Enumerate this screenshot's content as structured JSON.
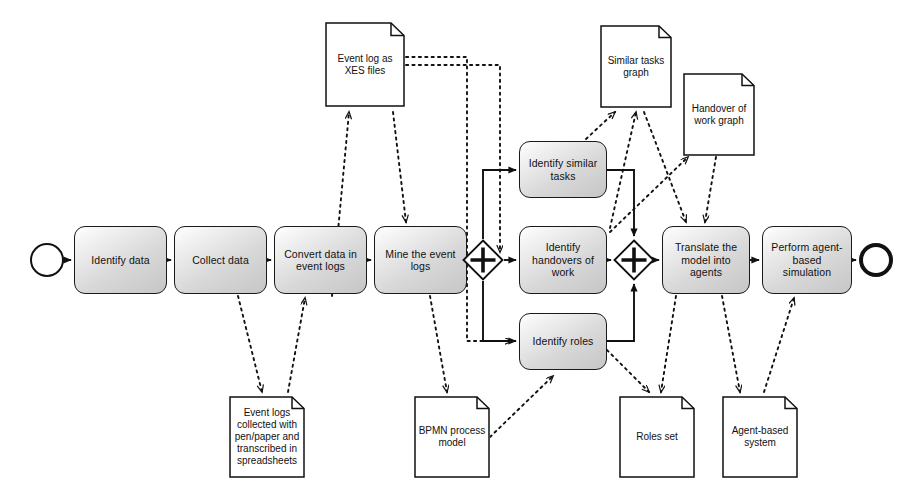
{
  "diagram": {
    "type": "BPMN process diagram",
    "notation": "bpmn",
    "background_color": "#ffffff",
    "line_color": "#111111",
    "task_fill_top": "#ffffff",
    "task_fill_bottom": "#c6c6c6"
  },
  "events": [
    {
      "id": "start",
      "kind": "start-event",
      "label": "",
      "x": 30,
      "y": 243,
      "d": 34
    },
    {
      "id": "end",
      "kind": "end-event",
      "label": "",
      "x": 859,
      "y": 243,
      "d": 34
    }
  ],
  "tasks": [
    {
      "id": "t1",
      "label": "Identify data",
      "x": 74,
      "y": 226,
      "w": 93,
      "h": 68
    },
    {
      "id": "t2",
      "label": "Collect data",
      "x": 174,
      "y": 226,
      "w": 93,
      "h": 68
    },
    {
      "id": "t3",
      "label": "Convert data in\nevent logs",
      "x": 274,
      "y": 226,
      "w": 93,
      "h": 68
    },
    {
      "id": "t4",
      "label": "Mine the event\nlogs",
      "x": 374,
      "y": 226,
      "w": 93,
      "h": 68
    },
    {
      "id": "t5",
      "label": "Identify similar\ntasks",
      "x": 519,
      "y": 141,
      "w": 88,
      "h": 57
    },
    {
      "id": "t6",
      "label": "Identify\nhandovers of\nwork",
      "x": 519,
      "y": 226,
      "w": 88,
      "h": 68
    },
    {
      "id": "t7",
      "label": "Identify roles",
      "x": 519,
      "y": 313,
      "w": 88,
      "h": 57
    },
    {
      "id": "t8",
      "label": "Translate the\nmodel into\nagents",
      "x": 662,
      "y": 226,
      "w": 88,
      "h": 68
    },
    {
      "id": "t9",
      "label": "Perform agent-\nbased simulation",
      "x": 762,
      "y": 226,
      "w": 90,
      "h": 68
    }
  ],
  "gateways": [
    {
      "id": "g1",
      "kind": "parallel-gateway-split",
      "symbol": "+",
      "cx": 483,
      "cy": 260,
      "r": 21
    },
    {
      "id": "g2",
      "kind": "parallel-gateway-join",
      "symbol": "+",
      "cx": 634,
      "cy": 260,
      "r": 21
    }
  ],
  "data_objects": [
    {
      "id": "d1",
      "label": "Event log as\nXES files",
      "x": 325,
      "y": 22,
      "w": 80,
      "h": 85
    },
    {
      "id": "d2",
      "label": "Similar tasks\ngraph",
      "x": 600,
      "y": 25,
      "w": 72,
      "h": 83
    },
    {
      "id": "d3",
      "label": "Handover of\nwork graph",
      "x": 683,
      "y": 73,
      "w": 72,
      "h": 83
    },
    {
      "id": "d4",
      "label": "Event logs\ncollected with\npen/paper and\ntranscribed in\nspreadsheets",
      "x": 229,
      "y": 396,
      "w": 76,
      "h": 82
    },
    {
      "id": "d5",
      "label": "BPMN process\nmodel",
      "x": 414,
      "y": 396,
      "w": 76,
      "h": 82
    },
    {
      "id": "d6",
      "label": "Roles set",
      "x": 619,
      "y": 396,
      "w": 76,
      "h": 82
    },
    {
      "id": "d7",
      "label": "Agent-based\nsystem",
      "x": 722,
      "y": 396,
      "w": 76,
      "h": 82
    }
  ],
  "sequence_flows": [
    {
      "from": "start",
      "to": "t1"
    },
    {
      "from": "t1",
      "to": "t2"
    },
    {
      "from": "t2",
      "to": "t3"
    },
    {
      "from": "t3",
      "to": "t4"
    },
    {
      "from": "t4",
      "to": "g1"
    },
    {
      "from": "g1",
      "to": "t5"
    },
    {
      "from": "g1",
      "to": "t6"
    },
    {
      "from": "g1",
      "to": "t7"
    },
    {
      "from": "t5",
      "to": "g2"
    },
    {
      "from": "t6",
      "to": "g2"
    },
    {
      "from": "t7",
      "to": "g2"
    },
    {
      "from": "g2",
      "to": "t8"
    },
    {
      "from": "t8",
      "to": "t9"
    },
    {
      "from": "t9",
      "to": "end"
    }
  ],
  "associations": [
    {
      "from": "t2",
      "to": "d4"
    },
    {
      "from": "d4",
      "to": "t3"
    },
    {
      "from": "t3",
      "to": "d1"
    },
    {
      "from": "d1",
      "to": "t4"
    },
    {
      "from": "t4",
      "to": "d5"
    },
    {
      "from": "d5",
      "to": "t7"
    },
    {
      "from": "d1",
      "to": "t6"
    },
    {
      "from": "d1",
      "to": "t7"
    },
    {
      "from": "t5",
      "to": "d2"
    },
    {
      "from": "t6",
      "to": "d2"
    },
    {
      "from": "t6",
      "to": "d3"
    },
    {
      "from": "d3",
      "to": "t8"
    },
    {
      "from": "d2",
      "to": "t8"
    },
    {
      "from": "t7",
      "to": "d6"
    },
    {
      "from": "t8",
      "to": "d6"
    },
    {
      "from": "t8",
      "to": "d7"
    },
    {
      "from": "d7",
      "to": "t9"
    }
  ]
}
